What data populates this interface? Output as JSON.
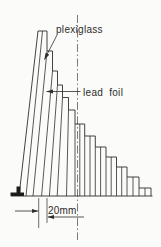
{
  "figure": {
    "title_labels": {
      "plexiglass": "plexiglass",
      "lead_foil": "lead foil",
      "dimension_text": "20mm"
    },
    "colors": {
      "ink": "#2e2e2e",
      "centerline": "#5a5a5a",
      "background": "#fbfbf9",
      "foot_fill": "#1c1c1c"
    },
    "wedge": {
      "baseline_y": 196,
      "baseline_x1": 11,
      "baseline_x2": 152.5,
      "left_edge": {
        "bottom": [
          19,
          196
        ],
        "top": [
          38,
          31
        ]
      },
      "treads": [
        {
          "x1": 38,
          "x2": 47,
          "y": 31
        },
        {
          "x1": 47,
          "x2": 52.5,
          "y": 51
        },
        {
          "x1": 52.5,
          "x2": 57.5,
          "y": 71
        },
        {
          "x1": 57.5,
          "x2": 62.5,
          "y": 85
        },
        {
          "x1": 62.5,
          "x2": 68.5,
          "y": 97.5
        },
        {
          "x1": 68.5,
          "x2": 75,
          "y": 110
        },
        {
          "x1": 75,
          "x2": 84.7,
          "y": 124
        },
        {
          "x1": 84.7,
          "x2": 95.3,
          "y": 136
        },
        {
          "x1": 95.3,
          "x2": 106,
          "y": 147
        },
        {
          "x1": 106,
          "x2": 116.5,
          "y": 157
        },
        {
          "x1": 116.5,
          "x2": 127,
          "y": 167
        },
        {
          "x1": 127,
          "x2": 139,
          "y": 177
        },
        {
          "x1": 139,
          "x2": 151,
          "y": 188
        }
      ],
      "slab_lines": [
        [
          47,
          51,
          33
        ],
        [
          52.5,
          71,
          41.6
        ],
        [
          57.5,
          85,
          49.4
        ],
        [
          62.5,
          97.5,
          57.2
        ],
        [
          68.5,
          110,
          66.5
        ],
        [
          75,
          124,
          75
        ],
        [
          84.7,
          136,
          84.7
        ],
        [
          95.3,
          147,
          95.3
        ],
        [
          106,
          157,
          106
        ],
        [
          116.5,
          167,
          116.5
        ],
        [
          127,
          177,
          127
        ],
        [
          139,
          188,
          139
        ],
        [
          42.5,
          31,
          26
        ],
        [
          79.8,
          124,
          79.8
        ],
        [
          90,
          136,
          90
        ],
        [
          100.6,
          147,
          100.6
        ],
        [
          111.2,
          157,
          111.2
        ],
        [
          121.7,
          167,
          121.7
        ],
        [
          133,
          177,
          133
        ],
        [
          145,
          188,
          145
        ]
      ],
      "foot_polygon": [
        [
          10.5,
          196
        ],
        [
          10.5,
          192.5
        ],
        [
          16.5,
          192.5
        ],
        [
          16.5,
          186.5
        ],
        [
          20.5,
          186.5
        ],
        [
          20.5,
          192.5
        ],
        [
          24,
          192.5
        ],
        [
          24,
          196
        ]
      ]
    },
    "centerline": {
      "x": 77.5,
      "y1": 15,
      "y2": 240,
      "dash": "8 2.5 1.5 2.5"
    },
    "leaders": {
      "plexiglass_arrow": {
        "from": [
          57,
          35
        ],
        "to": [
          44.5,
          59.5
        ]
      },
      "lead_foil_arrow": {
        "from": [
          80.5,
          91.5
        ],
        "to": [
          46.5,
          91.5
        ]
      }
    },
    "dimension": {
      "ext_lines": [
        [
          38.7,
          198,
          38.7,
          228
        ],
        [
          47,
          198,
          47,
          223
        ]
      ],
      "arrows": [
        {
          "from": [
            15,
            211
          ],
          "to": [
            38,
            211
          ]
        },
        {
          "from": [
            84,
            217
          ],
          "to": [
            47.8,
            217
          ]
        }
      ]
    }
  }
}
